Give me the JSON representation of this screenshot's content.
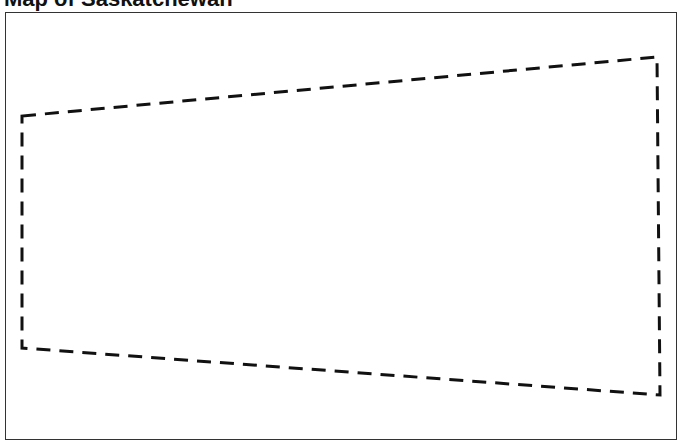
{
  "title": "Map of Saskatchewan",
  "map": {
    "boundary": {
      "style": "dashed",
      "color": "#111111",
      "points": [
        [
          22,
          116
        ],
        [
          657,
          57
        ],
        [
          660,
          395
        ],
        [
          22,
          348
        ]
      ]
    }
  }
}
